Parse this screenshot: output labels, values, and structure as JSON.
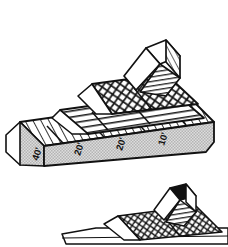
{
  "figure": {
    "background_color": "#ffffff",
    "line_color": "#111111",
    "face_fill": "#c9c9c9",
    "top_fill": "#ffffff",
    "accent_fill": "#e6e6e6"
  },
  "main_figure": {
    "name": "stepped-beam-upper",
    "tiers": [
      {
        "id": "tier-base",
        "pattern": "diagonal-hatch",
        "label": "base beam"
      },
      {
        "id": "tier-second",
        "pattern": "horizontal-lines",
        "label": "second tier"
      },
      {
        "id": "tier-third",
        "pattern": "cross-hatch",
        "label": "third tier"
      },
      {
        "id": "tier-top",
        "pattern": "horizontal-lines",
        "label": "top block"
      }
    ],
    "dimension_labels": [
      {
        "id": "dim-1",
        "text": "40'",
        "segment": 1
      },
      {
        "id": "dim-2",
        "text": "20'",
        "segment": 2
      },
      {
        "id": "dim-3",
        "text": "20'",
        "segment": 3
      },
      {
        "id": "dim-4",
        "text": "10'",
        "segment": 4
      }
    ],
    "segment_count": 4
  },
  "secondary_figure": {
    "name": "stepped-beam-lower",
    "note": "partial repeat of the same structure, cropped by the image edge",
    "tiers": [
      {
        "id": "tier2-base",
        "pattern": "plain",
        "label": "base beam"
      },
      {
        "id": "tier2-third",
        "pattern": "cross-hatch",
        "label": "cross-hatched tier"
      },
      {
        "id": "tier2-top",
        "pattern": "horizontal-lines",
        "label": "top block"
      }
    ]
  }
}
